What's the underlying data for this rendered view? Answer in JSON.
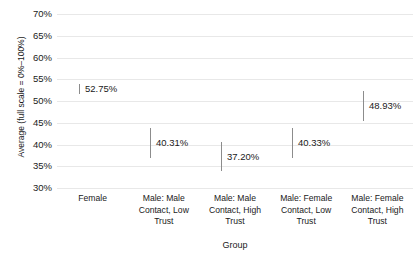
{
  "chart_data": {
    "type": "scatter",
    "title": "",
    "subtitle": "",
    "xlabel": "Group",
    "ylabel": "Average (full scale = 0%–100%)",
    "categories": [
      "Female",
      "Male: Male Contact, Low Trust",
      "Male: Male Contact, High Trust",
      "Male: Female Contact, Low Trust",
      "Male: Female Contact, High Trust"
    ],
    "category_lines": [
      [
        "Female"
      ],
      [
        "Male: Male",
        "Contact, Low",
        "Trust"
      ],
      [
        "Male: Male",
        "Contact, High",
        "Trust"
      ],
      [
        "Male: Female",
        "Contact, Low",
        "Trust"
      ],
      [
        "Male: Female",
        "Contact, High",
        "Trust"
      ]
    ],
    "values": [
      52.75,
      40.31,
      37.2,
      40.33,
      48.93
    ],
    "value_labels": [
      "52.75%",
      "40.31%",
      "37.20%",
      "40.33%",
      "48.93%"
    ],
    "intervals": [
      {
        "low": 51.6,
        "high": 53.9
      },
      {
        "low": 36.9,
        "high": 43.7
      },
      {
        "low": 33.8,
        "high": 40.6
      },
      {
        "low": 36.9,
        "high": 43.7
      },
      {
        "low": 45.5,
        "high": 52.3
      }
    ],
    "ylim": [
      30,
      70
    ],
    "yticks": [
      70,
      65,
      60,
      55,
      50,
      45,
      40,
      35,
      30
    ],
    "ytick_labels": [
      "70%",
      "65%",
      "60%",
      "55%",
      "50%",
      "45%",
      "40%",
      "35%",
      "30%"
    ],
    "grid": true,
    "legend": "none",
    "colors": {
      "background": "#ffffff",
      "gridline": "#e8e8e8",
      "marker": "#8c8c8c",
      "text": "#1a1a1a"
    }
  }
}
